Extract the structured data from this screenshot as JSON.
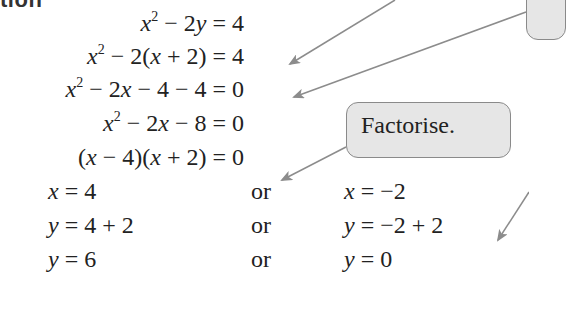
{
  "heading": {
    "text": "tion"
  },
  "equations": [
    {
      "id": "eq1",
      "parts": {
        "a": "x",
        "exp": "2",
        "b": " − 2",
        "c": "y",
        "d": " = 4"
      }
    },
    {
      "id": "eq2",
      "parts": {
        "a": "x",
        "exp": "2",
        "b": " − 2(",
        "c": "x",
        "d": " + 2) = 4"
      }
    },
    {
      "id": "eq3",
      "parts": {
        "a": "x",
        "exp": "2",
        "b": " − 2",
        "c": "x",
        "d": " − 4 − 4 = 0"
      }
    },
    {
      "id": "eq4",
      "parts": {
        "a": "x",
        "exp": "2",
        "b": " − 2",
        "c": "x",
        "d": " − 8 = 0"
      }
    },
    {
      "id": "eq5",
      "parts": {
        "p1": "(",
        "a": "x",
        "b": " − 4)(",
        "c": "x",
        "d": " + 2) = 0"
      }
    }
  ],
  "solutions": [
    {
      "left_var": "x",
      "left_rest": " = 4",
      "or": "or",
      "right_var": "x",
      "right_rest": " = −2"
    },
    {
      "left_var": "y",
      "left_rest": " = 4 + 2",
      "or": "or",
      "right_var": "y",
      "right_rest": " = −2 + 2"
    },
    {
      "left_var": "y",
      "left_rest": " = 6",
      "or": "or",
      "right_var": "y",
      "right_rest": " = 0"
    }
  ],
  "callouts": {
    "factorise": "Factorise."
  },
  "colors": {
    "callout_fill": "#e6e6e6",
    "callout_border": "#8a8a8a",
    "arrow": "#8c8c8c",
    "text": "#222222"
  }
}
